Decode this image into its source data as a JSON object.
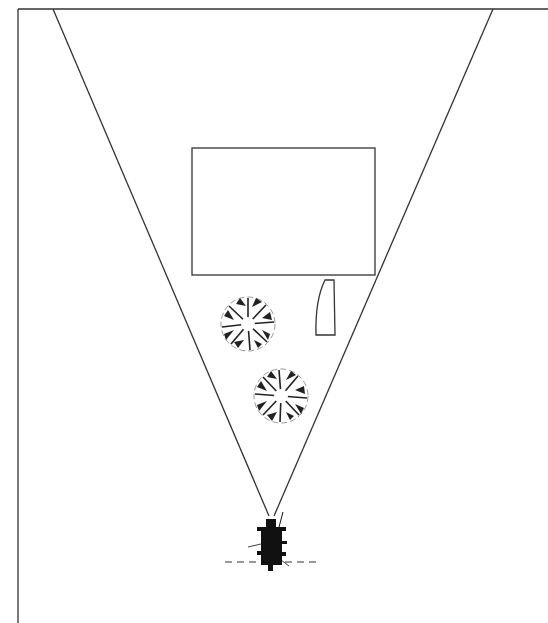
{
  "diagram": {
    "width": 548,
    "height": 623,
    "background": "#ffffff",
    "stroke_color": "#333333",
    "frame": {
      "left_x": 18,
      "top_y": 9,
      "right_extent": 548,
      "bottom_extent": 623
    },
    "view_cone": {
      "apex": [
        271,
        516
      ],
      "left_ray_top": [
        53,
        9
      ],
      "right_ray_top": [
        493,
        9
      ]
    },
    "elements": [
      {
        "type": "rectangle",
        "name": "building",
        "x": 192,
        "y": 148,
        "width": 183,
        "height": 127
      },
      {
        "type": "quadrilateral",
        "name": "car",
        "points": [
          [
            325,
            280
          ],
          [
            334,
            280
          ],
          [
            335,
            335
          ],
          [
            316,
            335
          ]
        ]
      },
      {
        "type": "tree",
        "name": "tree-1",
        "cx": 248,
        "cy": 324,
        "r": 28
      },
      {
        "type": "tree",
        "name": "tree-2",
        "cx": 281,
        "cy": 396,
        "r": 28
      },
      {
        "type": "observer",
        "name": "observer",
        "cx": 271,
        "cy": 545
      },
      {
        "type": "dashed-line",
        "name": "ground-line",
        "x1": 225,
        "x2": 318,
        "y": 562
      }
    ]
  }
}
